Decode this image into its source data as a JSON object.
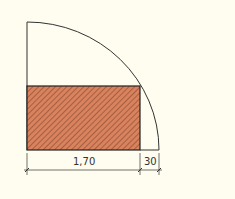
{
  "diagram": {
    "type": "door-swing-plan",
    "background_color": "#fefdf0",
    "line_color": "#333333",
    "fill_color": "#d9825e",
    "hatch_color": "#5a2a18",
    "dimensions": {
      "main_width_label": "1,70",
      "side_width_label": "30"
    }
  }
}
